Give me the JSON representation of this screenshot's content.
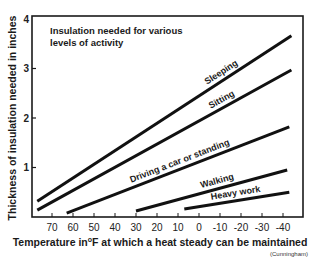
{
  "chart_data": {
    "type": "line",
    "title": "Insulation needed for various levels of activity",
    "xlabel": "Temperature in°F at which a heat steady can be maintained",
    "ylabel": "Thickness of insulation needed in inches",
    "source": "(Cunningham)",
    "x_ticks": [
      "70",
      "60",
      "50",
      "40",
      "30",
      "20",
      "10",
      "0",
      "-10",
      "-20",
      "-30",
      "-40"
    ],
    "y_ticks": [
      "1",
      "2",
      "3",
      "4"
    ],
    "xlim": [
      78,
      -48
    ],
    "ylim": [
      0,
      4
    ],
    "x_reversed": true,
    "grid": false,
    "legend": "inline labels on lines",
    "series": [
      {
        "name": "Sleeping",
        "points": [
          [
            77,
            0.32
          ],
          [
            -44,
            3.66
          ]
        ]
      },
      {
        "name": "Sitting",
        "points": [
          [
            77,
            0.14
          ],
          [
            -44,
            2.97
          ]
        ]
      },
      {
        "name": "Driving a car or standing",
        "points": [
          [
            63,
            0.08
          ],
          [
            -43,
            1.82
          ]
        ]
      },
      {
        "name": "Walking",
        "points": [
          [
            30,
            0.12
          ],
          [
            -42,
            0.95
          ]
        ]
      },
      {
        "name": "Heavy work",
        "points": [
          [
            7,
            0.16
          ],
          [
            -43,
            0.5
          ]
        ]
      }
    ]
  }
}
